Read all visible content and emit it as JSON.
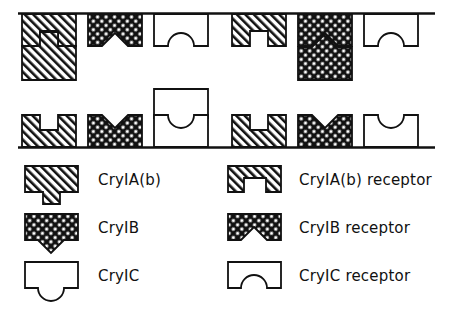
{
  "figure": {
    "colors": {
      "line": "#111111",
      "fill_empty": "#ffffff",
      "hatch_cryIAb": "#111111",
      "hatch_cryIB": "#111111",
      "background": "#ffffff"
    }
  },
  "legend": {
    "rows": [
      {
        "toxin": {
          "name": "CryIA(b)",
          "pattern": "diagonal-hatch",
          "shape": "square-tab-bottom"
        },
        "receptor": {
          "name": "CryIA(b) receptor",
          "pattern": "diagonal-hatch",
          "shape": "square-notch-bottom"
        }
      },
      {
        "toxin": {
          "name": "CryIB",
          "pattern": "cross-hatch",
          "shape": "triangle-tab-bottom"
        },
        "receptor": {
          "name": "CryIB receptor",
          "pattern": "cross-hatch",
          "shape": "triangle-notch-bottom"
        }
      },
      {
        "toxin": {
          "name": "CryIC",
          "pattern": "none",
          "shape": "round-tab-bottom"
        },
        "receptor": {
          "name": "CryIC receptor",
          "pattern": "none",
          "shape": "round-notch-bottom"
        }
      }
    ]
  },
  "membranes": [
    {
      "id": "upper-membrane",
      "name": "upper membrane",
      "receptors": [
        {
          "type": "CryIA(b) receptor",
          "pattern": "diagonal-hatch",
          "notch": "square",
          "bound_toxin": "CryIA(b)"
        },
        {
          "type": "CryIB receptor",
          "pattern": "cross-hatch",
          "notch": "triangle",
          "bound_toxin": null
        },
        {
          "type": "CryIC receptor",
          "pattern": "none",
          "notch": "round",
          "bound_toxin": null
        },
        {
          "type": "CryIA(b) receptor",
          "pattern": "diagonal-hatch",
          "notch": "square",
          "bound_toxin": null
        },
        {
          "type": "CryIB receptor",
          "pattern": "cross-hatch",
          "notch": "triangle",
          "bound_toxin": "CryIB"
        },
        {
          "type": "CryIC receptor",
          "pattern": "none",
          "notch": "round",
          "bound_toxin": null
        }
      ]
    },
    {
      "id": "lower-membrane",
      "name": "lower membrane",
      "receptors": [
        {
          "type": "CryIA(b) receptor",
          "pattern": "diagonal-hatch",
          "notch": "square",
          "bound_toxin": null
        },
        {
          "type": "CryIB receptor",
          "pattern": "cross-hatch",
          "notch": "triangle",
          "bound_toxin": null
        },
        {
          "type": "CryIC receptor",
          "pattern": "none",
          "notch": "round",
          "bound_toxin": null
        },
        {
          "type": "CryIA(b) receptor",
          "pattern": "diagonal-hatch",
          "notch": "square",
          "bound_toxin": null
        },
        {
          "type": "CryIB receptor",
          "pattern": "cross-hatch",
          "notch": "triangle",
          "bound_toxin": null
        },
        {
          "type": "CryIC receptor",
          "pattern": "none",
          "notch": "round",
          "bound_toxin": null
        }
      ],
      "free_toxins": [
        {
          "type": "CryIC",
          "pattern": "none",
          "tab": "round"
        }
      ]
    }
  ]
}
